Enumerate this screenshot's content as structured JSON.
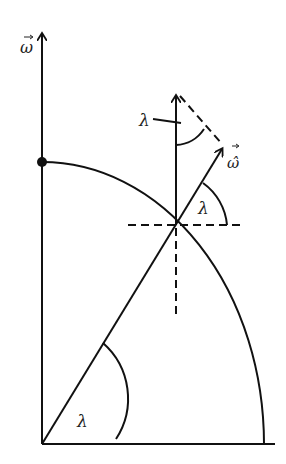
{
  "diagram": {
    "labels": {
      "axis_omega": "ω",
      "omega_hat": "ω̂",
      "lambda_top": "λ",
      "lambda_right": "λ",
      "lambda_bottom": "λ"
    },
    "colors": {
      "stroke": "#111111",
      "background": "#ffffff"
    }
  }
}
